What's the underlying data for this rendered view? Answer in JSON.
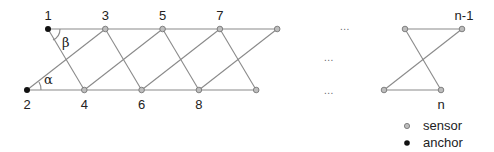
{
  "diagram": {
    "nodes": [
      {
        "id": "1",
        "label": "1",
        "type": "anchor",
        "row": "top",
        "col": 0
      },
      {
        "id": "2",
        "label": "2",
        "type": "anchor",
        "row": "bottom",
        "col": 0
      },
      {
        "id": "3",
        "label": "3",
        "type": "sensor",
        "row": "top",
        "col": 1
      },
      {
        "id": "4",
        "label": "4",
        "type": "sensor",
        "row": "bottom",
        "col": 1
      },
      {
        "id": "5",
        "label": "5",
        "type": "sensor",
        "row": "top",
        "col": 2
      },
      {
        "id": "6",
        "label": "6",
        "type": "sensor",
        "row": "bottom",
        "col": 2
      },
      {
        "id": "7",
        "label": "7",
        "type": "sensor",
        "row": "top",
        "col": 3
      },
      {
        "id": "8",
        "label": "8",
        "type": "sensor",
        "row": "bottom",
        "col": 3
      },
      {
        "id": "9",
        "label": "",
        "type": "sensor",
        "row": "top",
        "col": 4
      },
      {
        "id": "10",
        "label": "",
        "type": "sensor",
        "row": "bottom",
        "col": 4
      },
      {
        "id": "n-3",
        "label": "",
        "type": "sensor",
        "row": "top",
        "col": "r0"
      },
      {
        "id": "n-1",
        "label": "n-1",
        "type": "sensor",
        "row": "top",
        "col": "r1"
      },
      {
        "id": "n-2",
        "label": "",
        "type": "sensor",
        "row": "bottom",
        "col": "r0"
      },
      {
        "id": "n",
        "label": "n",
        "type": "sensor",
        "row": "bottom",
        "col": "r1"
      }
    ],
    "edges": [
      [
        "1",
        "3"
      ],
      [
        "3",
        "5"
      ],
      [
        "5",
        "7"
      ],
      [
        "7",
        "9"
      ],
      [
        "2",
        "4"
      ],
      [
        "4",
        "6"
      ],
      [
        "6",
        "8"
      ],
      [
        "8",
        "10"
      ],
      [
        "1",
        "4"
      ],
      [
        "3",
        "6"
      ],
      [
        "5",
        "8"
      ],
      [
        "7",
        "10"
      ],
      [
        "2",
        "3"
      ],
      [
        "4",
        "5"
      ],
      [
        "6",
        "7"
      ],
      [
        "8",
        "9"
      ],
      [
        "n-3",
        "n-1"
      ],
      [
        "n-2",
        "n"
      ],
      [
        "n-3",
        "n"
      ],
      [
        "n-2",
        "n-1"
      ]
    ],
    "angles": {
      "alpha": "α",
      "beta": "β"
    },
    "ellipsis": "...",
    "colors": {
      "sensor_fill": "#bdbdbd",
      "sensor_stroke": "#777777",
      "anchor_fill": "#111111",
      "edge": "#8a8a8a"
    }
  },
  "legend": {
    "items": [
      {
        "type": "sensor",
        "label": "sensor"
      },
      {
        "type": "anchor",
        "label": "anchor"
      }
    ]
  }
}
